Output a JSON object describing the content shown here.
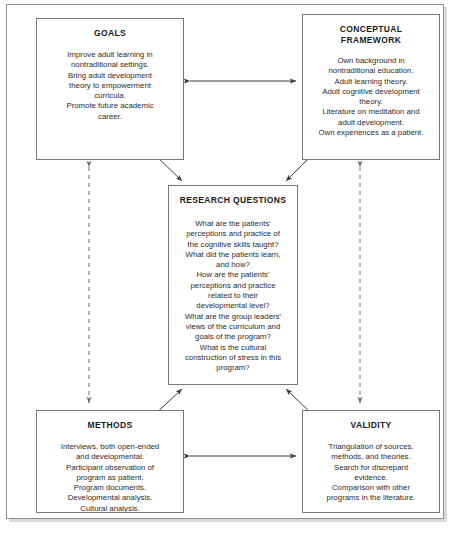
{
  "diagram": {
    "style": {
      "box_border_color": "#777777",
      "frame_border_color": "#8e8e8e",
      "arrow_color": "#3a3a3a",
      "dashed_arrow_color": "#6e6e6e",
      "background": "#ffffff"
    },
    "nodes": {
      "goals": {
        "title": "GOALS",
        "body": "Improve adult learning in\nnontraditional settings.\nBring adult development\ntheory to empowerment\ncurricula.\nPromote future academic\ncareer."
      },
      "conceptual_framework": {
        "title": "CONCEPTUAL\nFRAMEWORK",
        "body": "Own background in\nnontraditional education.\nAdult learning theory.\nAdult cognitive development\ntheory.\nLiterature on meditation and\nadult development.\nOwn experiences as a patient."
      },
      "research_questions": {
        "title": "RESEARCH QUESTIONS",
        "body": "What are the patients'\nperceptions and practice of\nthe cognitive skills taught?\nWhat did the patients learn,\nand how?\nHow are the patients'\nperceptions and practice\nrelated to their\ndevelopmental level?\nWhat are the group leaders'\nviews of the curriculum and\ngoals of the program?\nWhat is the cultural\nconstruction of stress in this\nprogram?"
      },
      "methods": {
        "title": "METHODS",
        "body": "Interviews, both open-ended\nand developmental.\nParticipant observation of\nprogram as patient.\nProgram documents.\nDevelopmental analysis.\nCultural analysis."
      },
      "validity": {
        "title": "VALIDITY",
        "body": "Triangulation of sources,\nmethods, and theories.\nSearch for discrepant\nevidence.\nComparison with other\nprograms in the literature."
      }
    },
    "connectors": [
      {
        "id": "goals-framework",
        "from": "goals",
        "to": "conceptual_framework",
        "style": "solid",
        "heads": "both",
        "orientation": "horizontal"
      },
      {
        "id": "methods-validity",
        "from": "methods",
        "to": "validity",
        "style": "solid",
        "heads": "both",
        "orientation": "horizontal"
      },
      {
        "id": "goals-methods",
        "from": "goals",
        "to": "methods",
        "style": "dashed",
        "heads": "both",
        "orientation": "vertical"
      },
      {
        "id": "framework-validity",
        "from": "conceptual_framework",
        "to": "validity",
        "style": "dashed",
        "heads": "both",
        "orientation": "vertical"
      },
      {
        "id": "goals-questions",
        "from": "goals",
        "to": "research_questions",
        "style": "solid",
        "heads": "both",
        "orientation": "diagonal"
      },
      {
        "id": "framework-questions",
        "from": "conceptual_framework",
        "to": "research_questions",
        "style": "solid",
        "heads": "both",
        "orientation": "diagonal"
      },
      {
        "id": "methods-questions",
        "from": "methods",
        "to": "research_questions",
        "style": "solid",
        "heads": "both",
        "orientation": "diagonal"
      },
      {
        "id": "validity-questions",
        "from": "validity",
        "to": "research_questions",
        "style": "solid",
        "heads": "both",
        "orientation": "diagonal"
      }
    ]
  }
}
